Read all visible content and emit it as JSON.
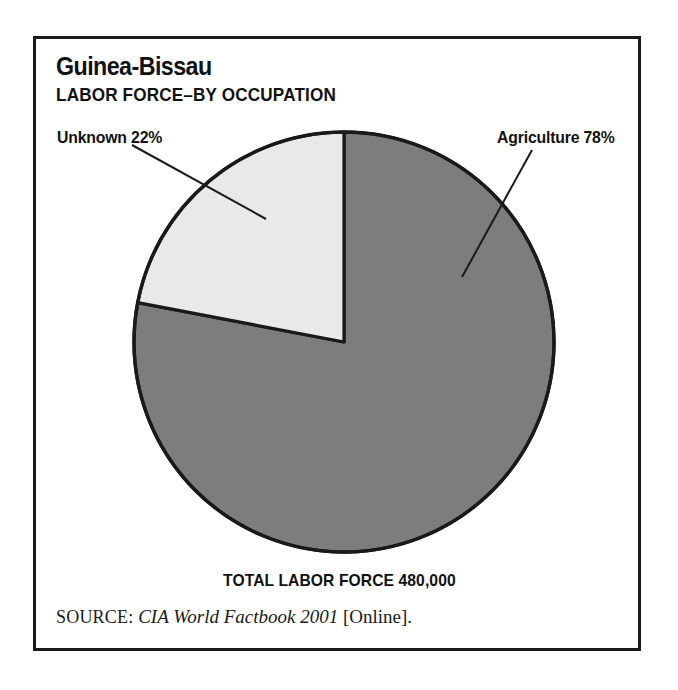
{
  "figure": {
    "title": "Guinea-Bissau",
    "subtitle": "LABOR FORCE–BY OCCUPATION",
    "total_label": "TOTAL LABOR FORCE 480,000",
    "source_prefix": "SOURCE:",
    "source_title": "CIA World Factbook 2001",
    "source_suffix": "[Online]."
  },
  "labels": {
    "unknown": "Unknown 22%",
    "agriculture": "Agriculture 78%"
  },
  "chart_data": {
    "type": "pie",
    "title": "Guinea-Bissau",
    "subtitle": "LABOR FORCE–BY OCCUPATION",
    "unit": "percent",
    "total": 480000,
    "total_label": "TOTAL LABOR FORCE 480,000",
    "categories": [
      "Agriculture",
      "Unknown"
    ],
    "values": [
      78,
      22
    ],
    "labels": [
      "Agriculture 78%",
      "Unknown 22%"
    ],
    "colors": [
      "#7d7d7d",
      "#e9e9e9"
    ],
    "start_angle_deg": 0,
    "direction": "agriculture-clockwise-from-top",
    "legend": "none",
    "grid": false,
    "annotations": [
      "Unknown 22%",
      "Agriculture 78%",
      "TOTAL LABOR FORCE 480,000"
    ],
    "source": "CIA World Factbook 2001 [Online]."
  },
  "geometry": {
    "center_x": 344,
    "center_y": 342,
    "radius": 210
  },
  "colors": {
    "slice_agriculture": "#7d7d7d",
    "slice_unknown": "#e9e9e9",
    "outline": "#1a1a1a",
    "frame": "#1a1a1a",
    "text": "#111111",
    "background": "#ffffff"
  }
}
